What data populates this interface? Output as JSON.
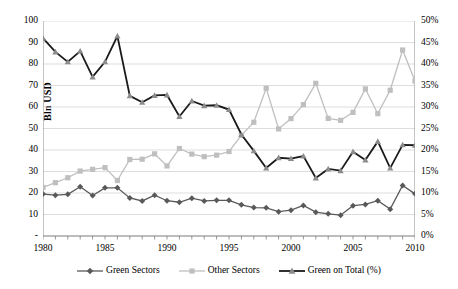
{
  "chart_data": {
    "type": "line",
    "title": "",
    "xlabel": "",
    "ylabel": "Bln USD",
    "y2label": "",
    "x": [
      1980,
      1981,
      1982,
      1983,
      1984,
      1985,
      1986,
      1987,
      1988,
      1989,
      1990,
      1991,
      1992,
      1993,
      1994,
      1995,
      1996,
      1997,
      1998,
      1999,
      2000,
      2001,
      2002,
      2003,
      2004,
      2005,
      2006,
      2007,
      2008,
      2009,
      2010
    ],
    "xlim": [
      1980,
      2010
    ],
    "ylim": [
      0,
      100
    ],
    "y2lim": [
      0,
      0.5
    ],
    "ytick_labels": [
      "100",
      "90",
      "80",
      "70",
      "60",
      "50",
      "40",
      "30",
      "20",
      "10",
      "-"
    ],
    "ytick_values": [
      100,
      90,
      80,
      70,
      60,
      50,
      40,
      30,
      20,
      10,
      0
    ],
    "y2tick_labels": [
      "50%",
      "45%",
      "40%",
      "35%",
      "30%",
      "25%",
      "20%",
      "15%",
      "10%",
      "5%",
      "0%"
    ],
    "y2tick_values": [
      50,
      45,
      40,
      35,
      30,
      25,
      20,
      15,
      10,
      5,
      0
    ],
    "xtick_labels": [
      "1980",
      "1985",
      "1990",
      "1995",
      "2000",
      "2005",
      "2010"
    ],
    "xtick_values": [
      1980,
      1985,
      1990,
      1995,
      2000,
      2005,
      2010
    ],
    "grid": "horizontal",
    "legend_position": "bottom",
    "series": [
      {
        "name": "Green Sectors",
        "axis": "left",
        "marker": "diamond",
        "color": "#595959",
        "values": [
          19.5,
          19.0,
          19.4,
          22.9,
          18.8,
          22.4,
          22.4,
          17.7,
          16.3,
          19.0,
          16.4,
          15.7,
          17.6,
          16.3,
          16.6,
          16.6,
          14.5,
          13.2,
          13.1,
          11.3,
          12.0,
          14.2,
          11.1,
          10.3,
          9.7,
          14.1,
          14.7,
          16.4,
          12.5,
          23.5,
          19.6
        ]
      },
      {
        "name": "Other Sectors",
        "axis": "left",
        "marker": "square",
        "color": "#bfbfbf",
        "values": [
          22.6,
          24.8,
          27.1,
          30.2,
          31.0,
          31.8,
          25.8,
          35.6,
          35.7,
          38.2,
          32.6,
          40.7,
          38.1,
          36.9,
          37.6,
          39.3,
          46.8,
          52.9,
          68.7,
          49.8,
          54.6,
          61.1,
          71.0,
          54.7,
          53.8,
          57.5,
          68.4,
          56.9,
          67.8,
          86.5,
          72.1
        ]
      },
      {
        "name": "Green on Total (%)",
        "axis": "right",
        "marker": "triangle",
        "color": "#404040",
        "values": [
          46.0,
          42.8,
          40.5,
          43.0,
          37.0,
          40.5,
          46.5,
          32.6,
          31.1,
          32.7,
          32.8,
          27.8,
          31.4,
          30.3,
          30.4,
          29.4,
          23.6,
          19.8,
          15.8,
          18.2,
          18.0,
          18.6,
          13.5,
          15.6,
          15.2,
          19.6,
          17.7,
          22.0,
          15.8,
          21.2,
          21.1
        ]
      }
    ]
  },
  "legend": {
    "items": [
      {
        "label": "Green Sectors",
        "marker": "diamond-marker",
        "color": "#595959"
      },
      {
        "label": "Other Sectors",
        "marker": "square-marker",
        "color": "#bfbfbf"
      },
      {
        "label": "Green on Total (%)",
        "marker": "triangle-marker",
        "color": "#404040"
      }
    ]
  }
}
